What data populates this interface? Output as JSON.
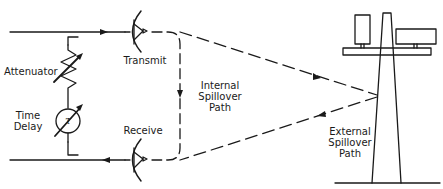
{
  "diagram": {
    "type": "signal-path-schematic",
    "labels": {
      "attenuator": "Attenuator",
      "time_delay_line1": "Time",
      "time_delay_line2": "Delay",
      "time_delay_symbol": "τ",
      "transmit": "Transmit",
      "receive": "Receive",
      "internal_line1": "Internal",
      "internal_line2": "Spillover",
      "internal_line3": "Path",
      "external_line1": "External",
      "external_line2": "Spillover",
      "external_line3": "Path"
    },
    "components": [
      {
        "id": "transmit-antenna",
        "kind": "dish-antenna"
      },
      {
        "id": "receive-antenna",
        "kind": "dish-antenna"
      },
      {
        "id": "attenuator",
        "kind": "variable-resistor"
      },
      {
        "id": "time-delay",
        "kind": "variable-delay"
      },
      {
        "id": "tower",
        "kind": "tower-with-reflectors"
      }
    ],
    "paths": [
      {
        "id": "internal-spillover",
        "style": "dashed",
        "from": "transmit-antenna",
        "to": "receive-antenna"
      },
      {
        "id": "external-spillover",
        "style": "dashed",
        "from": "transmit-antenna",
        "via": "tower",
        "to": "receive-antenna"
      }
    ],
    "colors": {
      "stroke": "#1a1a1a",
      "background": "#ffffff"
    }
  }
}
